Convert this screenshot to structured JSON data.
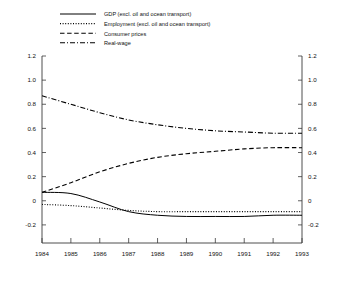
{
  "chart_data": {
    "type": "line",
    "title": "",
    "subtitle": "",
    "xlabel": "",
    "ylabel": "",
    "xlim": [
      1984,
      1993
    ],
    "ylim": [
      -0.35,
      1.2
    ],
    "grid": false,
    "legend_position": "top-left",
    "dual_axis": true,
    "y_ticks": [
      1.2,
      1.0,
      0.8,
      0.6,
      0.4,
      0.2,
      0,
      -0.2
    ],
    "y_tick_labels": [
      "1.2",
      "1.0",
      "0.8",
      "0.6",
      "0.4",
      "0.2",
      "0",
      "-0.2"
    ],
    "y_ticks_right": [
      1.2,
      1.0,
      0.8,
      0.6,
      0.4,
      0.2,
      0,
      -0.2
    ],
    "y_tick_labels_right": [
      "1.2",
      "1.0",
      "0.8",
      "0.6",
      "0.4",
      "0.2",
      "0",
      "-0.2"
    ],
    "x_ticks": [
      1984,
      1985,
      1986,
      1987,
      1988,
      1989,
      1990,
      1991,
      1992,
      1993
    ],
    "x_tick_labels": [
      "1984",
      "1985",
      "1986",
      "1987",
      "1988",
      "1989",
      "1990",
      "1991",
      "1992",
      "1993"
    ],
    "x": [
      1984,
      1985,
      1986,
      1987,
      1988,
      1989,
      1990,
      1991,
      1992,
      1993
    ],
    "series": [
      {
        "name": "GDP (excl. oil and ocean transport)",
        "style": "solid",
        "color": "#000000",
        "values": [
          0.07,
          0.06,
          -0.01,
          -0.09,
          -0.12,
          -0.13,
          -0.13,
          -0.13,
          -0.12,
          -0.12
        ]
      },
      {
        "name": "Employment (excl. oil and ocean transport)",
        "style": "dotted",
        "color": "#000000",
        "values": [
          -0.03,
          -0.04,
          -0.06,
          -0.08,
          -0.09,
          -0.09,
          -0.09,
          -0.09,
          -0.09,
          -0.09
        ]
      },
      {
        "name": "Consumer prices",
        "style": "dashed",
        "color": "#000000",
        "values": [
          0.07,
          0.15,
          0.24,
          0.31,
          0.36,
          0.39,
          0.41,
          0.43,
          0.44,
          0.44
        ]
      },
      {
        "name": "Real-wage",
        "style": "dashdot",
        "color": "#000000",
        "values": [
          0.87,
          0.8,
          0.73,
          0.67,
          0.63,
          0.6,
          0.58,
          0.57,
          0.56,
          0.56
        ]
      }
    ]
  },
  "legend": {
    "entries": [
      {
        "label": "GDP (excl. oil and ocean transport)",
        "style": "solid"
      },
      {
        "label": "Employment (excl. oil and ocean transport)",
        "style": "dotted"
      },
      {
        "label": "Consumer prices",
        "style": "dashed"
      },
      {
        "label": "Real-wage",
        "style": "dashdot"
      }
    ]
  }
}
